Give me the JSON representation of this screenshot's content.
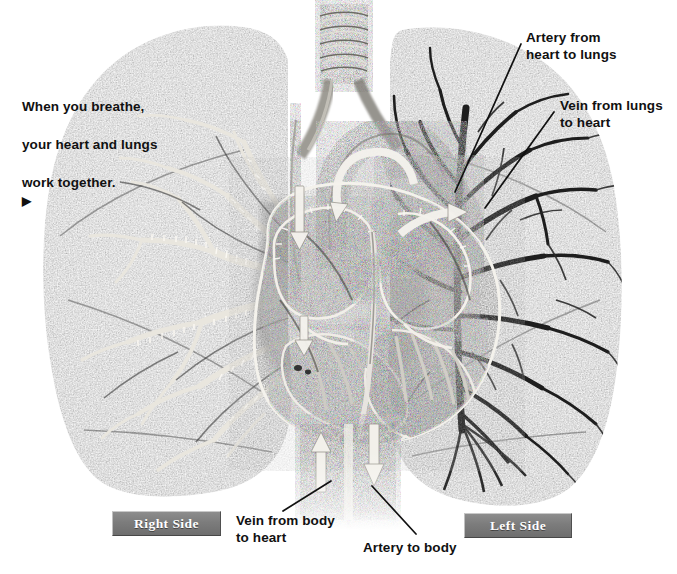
{
  "figure": {
    "style": "grayscale anatomical illustration",
    "background_color": "#ffffff",
    "width": 677,
    "height": 574
  },
  "intro": {
    "line1": "When you breathe,",
    "line2": "your heart and lungs",
    "line3": "work together.",
    "arrow_glyph": "▶",
    "x": 22,
    "y": 78
  },
  "labels": [
    {
      "id": "artery-from-heart-to-lungs",
      "text": "Artery from\nheart to lungs",
      "x": 526,
      "y": 30,
      "leader": {
        "x1": 521,
        "y1": 44,
        "x2": 455,
        "y2": 192
      }
    },
    {
      "id": "vein-from-lungs-to-heart",
      "text": "Vein from lungs\nto heart",
      "x": 560,
      "y": 98,
      "leader": {
        "x1": 554,
        "y1": 112,
        "x2": 485,
        "y2": 208
      }
    },
    {
      "id": "vein-from-body-to-heart",
      "text": "Vein from body\nto heart",
      "x": 236,
      "y": 513,
      "leader": {
        "x1": 331,
        "y1": 481,
        "x2": 283,
        "y2": 511
      }
    },
    {
      "id": "artery-to-body",
      "text": "Artery to body",
      "x": 363,
      "y": 540,
      "leader": {
        "x1": 372,
        "y1": 486,
        "x2": 416,
        "y2": 534
      }
    }
  ],
  "side_badges": [
    {
      "id": "right-side",
      "label": "Right Side",
      "x": 112,
      "y": 511,
      "w": 107,
      "h": 23
    },
    {
      "id": "left-side",
      "label": "Left Side",
      "x": 464,
      "y": 513,
      "w": 106,
      "h": 23
    }
  ],
  "anatomy": {
    "trachea": {
      "label": "trachea",
      "rings": 6,
      "x": 322,
      "y": 6,
      "w": 44,
      "h": 76
    },
    "right_lung_of_patient": {
      "label": "right lung (viewer left)",
      "tree_tone": "light",
      "tree_color": "#ece9e2",
      "tissue_color": "#9a9a9a"
    },
    "left_lung_of_patient": {
      "label": "left lung (viewer right)",
      "tree_tone": "dark",
      "tree_color": "#1d1d1d",
      "tissue_color": "#9a9a9a"
    },
    "heart": {
      "label": "heart cross-section",
      "chambers": [
        "right atrium",
        "right ventricle",
        "left atrium",
        "left ventricle"
      ],
      "outline_color": "#f2f0ea"
    },
    "vessels_bottom": [
      {
        "id": "inferior-vena-cava",
        "flow": "up",
        "arrow_glyph": "↑"
      },
      {
        "id": "descending-aorta",
        "flow": "down",
        "arrow_glyph": "↓"
      }
    ],
    "flow_arrows": [
      {
        "id": "svc-down-arrow",
        "direction": "down",
        "x": 300,
        "y": 196
      },
      {
        "id": "aortic-arch-arrow",
        "direction": "curve",
        "x": 348,
        "y": 200
      },
      {
        "id": "pulmonary-arrow",
        "direction": "right",
        "x": 408,
        "y": 246
      },
      {
        "id": "ra-inflow-arrow",
        "direction": "down",
        "x": 305,
        "y": 340
      }
    ]
  },
  "colors": {
    "ink": "#111111",
    "badge_fill": "#7c7c7c",
    "badge_text": "#ffffff",
    "tissue_mid": "#9a9a9a",
    "tissue_dark": "#5d5d5d",
    "tissue_light": "#c4c4c4",
    "vessel_dark": "#2a2a2a",
    "highlight": "#f3f1ec"
  }
}
